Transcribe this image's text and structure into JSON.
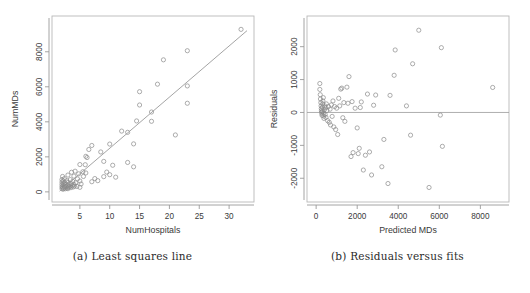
{
  "figure": {
    "panel_a": {
      "caption": "(a) Least squares line",
      "xlabel": "NumHospitals",
      "ylabel": "NumMDs"
    },
    "panel_b": {
      "caption": "(b) Residuals versus fits",
      "xlabel": "Predicted MDs",
      "ylabel": "Residuals"
    }
  },
  "chart_data": [
    {
      "type": "scatter",
      "title": "",
      "panel": "a",
      "caption": "(a) Least squares line",
      "xlabel": "NumHospitals",
      "ylabel": "NumMDs",
      "xlim": [
        1,
        33.5
      ],
      "ylim": [
        -350,
        9700
      ],
      "xticks": [
        5,
        10,
        15,
        20,
        25,
        30
      ],
      "yticks": [
        0,
        2000,
        4000,
        6000,
        8000
      ],
      "grid": false,
      "legend": null,
      "marker": "open-circle",
      "fit_line": {
        "type": "least-squares",
        "slope": 292,
        "intercept": -430,
        "x_start": 1.6,
        "x_end": 33.0,
        "y_start": 37,
        "y_end": 9206
      },
      "points": [
        [
          2.0,
          180
        ],
        [
          2.0,
          300
        ],
        [
          2.0,
          430
        ],
        [
          2.0,
          560
        ],
        [
          2.0,
          700
        ],
        [
          2.1,
          250
        ],
        [
          2.1,
          880
        ],
        [
          2.2,
          150
        ],
        [
          2.2,
          380
        ],
        [
          2.2,
          620
        ],
        [
          2.3,
          200
        ],
        [
          2.3,
          470
        ],
        [
          2.4,
          330
        ],
        [
          2.4,
          760
        ],
        [
          2.5,
          260
        ],
        [
          2.5,
          520
        ],
        [
          2.6,
          180
        ],
        [
          2.6,
          410
        ],
        [
          2.7,
          300
        ],
        [
          2.8,
          640
        ],
        [
          2.9,
          230
        ],
        [
          3.0,
          180
        ],
        [
          3.0,
          350
        ],
        [
          3.0,
          540
        ],
        [
          3.0,
          960
        ],
        [
          3.1,
          270
        ],
        [
          3.2,
          420
        ],
        [
          3.3,
          300
        ],
        [
          3.4,
          700
        ],
        [
          3.5,
          240
        ],
        [
          3.5,
          480
        ],
        [
          3.6,
          1120
        ],
        [
          3.7,
          350
        ],
        [
          3.8,
          600
        ],
        [
          3.9,
          280
        ],
        [
          4.0,
          430
        ],
        [
          4.0,
          900
        ],
        [
          4.1,
          330
        ],
        [
          4.2,
          1180
        ],
        [
          4.3,
          520
        ],
        [
          4.5,
          310
        ],
        [
          4.6,
          740
        ],
        [
          4.8,
          1030
        ],
        [
          5.0,
          260
        ],
        [
          5.0,
          620
        ],
        [
          5.0,
          1560
        ],
        [
          5.2,
          450
        ],
        [
          5.5,
          1150
        ],
        [
          5.6,
          880
        ],
        [
          5.9,
          1550
        ],
        [
          6.0,
          1080
        ],
        [
          6.0,
          2030
        ],
        [
          6.2,
          1960
        ],
        [
          6.5,
          2420
        ],
        [
          7.0,
          2650
        ],
        [
          7.0,
          580
        ],
        [
          7.5,
          760
        ],
        [
          8.0,
          640
        ],
        [
          8.5,
          2280
        ],
        [
          9.0,
          1740
        ],
        [
          9.0,
          870
        ],
        [
          9.5,
          1130
        ],
        [
          10.0,
          2730
        ],
        [
          10.0,
          980
        ],
        [
          10.5,
          1520
        ],
        [
          11.0,
          840
        ],
        [
          12.0,
          3470
        ],
        [
          13.0,
          1680
        ],
        [
          13.0,
          3400
        ],
        [
          14.0,
          1430
        ],
        [
          14.0,
          2740
        ],
        [
          14.5,
          4050
        ],
        [
          15.0,
          5720
        ],
        [
          15.0,
          4960
        ],
        [
          17.0,
          4560
        ],
        [
          17.0,
          4030
        ],
        [
          18.0,
          6150
        ],
        [
          19.0,
          7540
        ],
        [
          21.0,
          3250
        ],
        [
          23.0,
          8060
        ],
        [
          23.0,
          6050
        ],
        [
          23.0,
          5060
        ],
        [
          32.0,
          9280
        ]
      ]
    },
    {
      "type": "scatter",
      "title": "",
      "panel": "b",
      "caption": "(b) Residuals versus fits",
      "xlabel": "Predicted MDs",
      "ylabel": "Residuals",
      "xlim": [
        -250,
        9200
      ],
      "ylim": [
        -2600,
        2750
      ],
      "xticks": [
        0,
        2000,
        4000,
        6000,
        8000
      ],
      "yticks": [
        -2000,
        -1000,
        0,
        1000,
        2000
      ],
      "grid": false,
      "legend": null,
      "marker": "open-circle",
      "reference_line": {
        "y": 0
      },
      "points": [
        [
          180,
          880
        ],
        [
          180,
          700
        ],
        [
          200,
          540
        ],
        [
          210,
          410
        ],
        [
          230,
          300
        ],
        [
          240,
          200
        ],
        [
          250,
          120
        ],
        [
          260,
          60
        ],
        [
          270,
          10
        ],
        [
          280,
          -40
        ],
        [
          290,
          -90
        ],
        [
          300,
          30
        ],
        [
          310,
          160
        ],
        [
          320,
          260
        ],
        [
          330,
          350
        ],
        [
          350,
          450
        ],
        [
          360,
          -20
        ],
        [
          370,
          -110
        ],
        [
          380,
          -180
        ],
        [
          400,
          80
        ],
        [
          420,
          200
        ],
        [
          440,
          -60
        ],
        [
          460,
          140
        ],
        [
          480,
          -150
        ],
        [
          500,
          260
        ],
        [
          520,
          60
        ],
        [
          560,
          -250
        ],
        [
          600,
          180
        ],
        [
          640,
          -300
        ],
        [
          680,
          100
        ],
        [
          700,
          -380
        ],
        [
          740,
          230
        ],
        [
          780,
          -120
        ],
        [
          820,
          350
        ],
        [
          860,
          -440
        ],
        [
          900,
          180
        ],
        [
          950,
          -520
        ],
        [
          1000,
          130
        ],
        [
          1050,
          -670
        ],
        [
          1100,
          430
        ],
        [
          1150,
          200
        ],
        [
          1200,
          710
        ],
        [
          1250,
          740
        ],
        [
          1300,
          -160
        ],
        [
          1350,
          300
        ],
        [
          1400,
          -270
        ],
        [
          1500,
          770
        ],
        [
          1550,
          280
        ],
        [
          1600,
          1090
        ],
        [
          1700,
          -1340
        ],
        [
          1750,
          330
        ],
        [
          1800,
          -1220
        ],
        [
          1900,
          130
        ],
        [
          2000,
          -470
        ],
        [
          2050,
          -1250
        ],
        [
          2100,
          -1090
        ],
        [
          2150,
          150
        ],
        [
          2200,
          320
        ],
        [
          2300,
          -1750
        ],
        [
          2400,
          -1300
        ],
        [
          2500,
          560
        ],
        [
          2600,
          -1200
        ],
        [
          2700,
          -1900
        ],
        [
          2800,
          220
        ],
        [
          2900,
          530
        ],
        [
          3200,
          -1650
        ],
        [
          3300,
          -820
        ],
        [
          3500,
          -2160
        ],
        [
          3600,
          520
        ],
        [
          3800,
          1130
        ],
        [
          3850,
          1900
        ],
        [
          4400,
          200
        ],
        [
          4600,
          -690
        ],
        [
          4700,
          1480
        ],
        [
          5000,
          2500
        ],
        [
          5500,
          -2280
        ],
        [
          6050,
          -80
        ],
        [
          6100,
          1970
        ],
        [
          6150,
          -1030
        ],
        [
          8600,
          760
        ]
      ]
    }
  ]
}
